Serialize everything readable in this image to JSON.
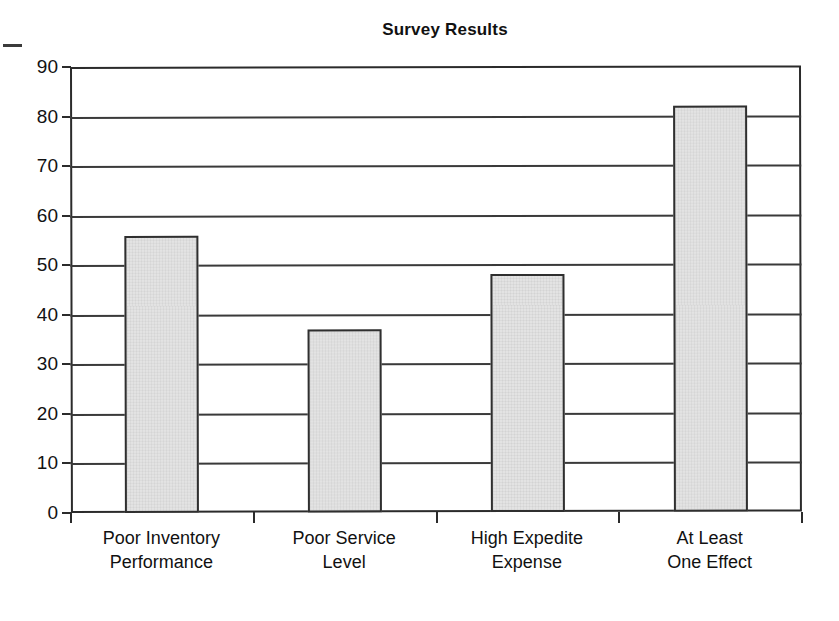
{
  "chart_data": {
    "type": "bar",
    "title": "Survey Results",
    "xlabel": "",
    "ylabel": "",
    "categories": [
      "Poor Inventory Performance",
      "Poor Service Level",
      "High Expedite Expense",
      "At Least One Effect"
    ],
    "category_lines": [
      [
        "Poor Inventory",
        "Performance"
      ],
      [
        "Poor Service",
        "Level"
      ],
      [
        "High Expedite",
        "Expense"
      ],
      [
        "At Least",
        "One Effect"
      ]
    ],
    "values": [
      56,
      37,
      48,
      82
    ],
    "ylim": [
      0,
      90
    ],
    "ytick_labels": [
      "90",
      "80",
      "70",
      "60",
      "50",
      "40",
      "30",
      "20",
      "10",
      "0"
    ],
    "ytick_values": [
      90,
      80,
      70,
      60,
      50,
      40,
      30,
      20,
      10,
      0
    ],
    "grid": "horizontal",
    "legend": "none",
    "bar_fill_color": "#e3e3e3",
    "bar_border_color": "#2f2f2f",
    "axis_color": "#2b2b2b",
    "background_color": "#ffffff",
    "title_color": "#111111"
  }
}
